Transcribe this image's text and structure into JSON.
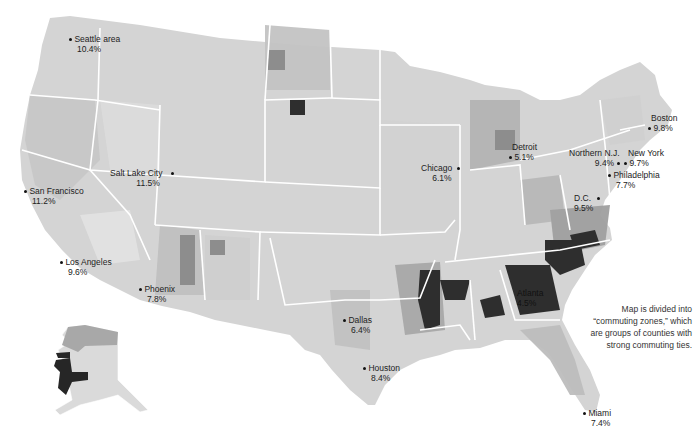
{
  "map": {
    "type": "choropleth",
    "subject": "US commuting zones shaded by percentage",
    "note": "Map is divided into “commuting zones,” which are groups of counties with strong commuting ties.",
    "scale_colors": [
      "#eeeeee",
      "#dadada",
      "#c4c4c4",
      "#a8a8a8",
      "#8a8a8a",
      "#555555",
      "#262626"
    ],
    "cities": [
      {
        "name": "Seattle area",
        "value": "10.4%",
        "x": 72,
        "y": 38,
        "align": "right"
      },
      {
        "name": "Salt Lake City",
        "value": "11.5%",
        "x": 164,
        "y": 172,
        "align": "left"
      },
      {
        "name": "San Francisco",
        "value": "11.2%",
        "x": 27,
        "y": 190,
        "align": "right"
      },
      {
        "name": "Los Angeles",
        "value": "9.6%",
        "x": 63,
        "y": 261,
        "align": "right"
      },
      {
        "name": "Phoenix",
        "value": "7.8%",
        "x": 142,
        "y": 288,
        "align": "right"
      },
      {
        "name": "Dallas",
        "value": "6.4%",
        "x": 346,
        "y": 319,
        "align": "right"
      },
      {
        "name": "Houston",
        "value": "8.4%",
        "x": 366,
        "y": 367,
        "align": "right"
      },
      {
        "name": "Chicago",
        "value": "6.1%",
        "x": 456,
        "y": 167,
        "align": "left"
      },
      {
        "name": "Detroit",
        "value": "5.1%",
        "x": 510,
        "y": 152,
        "align": "right"
      },
      {
        "name": "Atlanta",
        "value": "4.5%",
        "x": 515,
        "y": 298,
        "align": "right"
      },
      {
        "name": "Miami",
        "value": "7.4%",
        "x": 586,
        "y": 412,
        "align": "right"
      },
      {
        "name": "Northern N.J.",
        "value": "9.4%",
        "x": 619,
        "y": 160,
        "align": "left"
      },
      {
        "name": "New York",
        "value": "9.7%",
        "x": 622,
        "y": 160,
        "align": "right"
      },
      {
        "name": "Philadelphia",
        "value": "7.7%",
        "x": 610,
        "y": 174,
        "align": "right"
      },
      {
        "name": "D.C.",
        "value": "9.5%",
        "x": 591,
        "y": 196,
        "align": "left"
      },
      {
        "name": "Boston",
        "value": "9.8%",
        "x": 649,
        "y": 126,
        "align": "right"
      }
    ]
  }
}
